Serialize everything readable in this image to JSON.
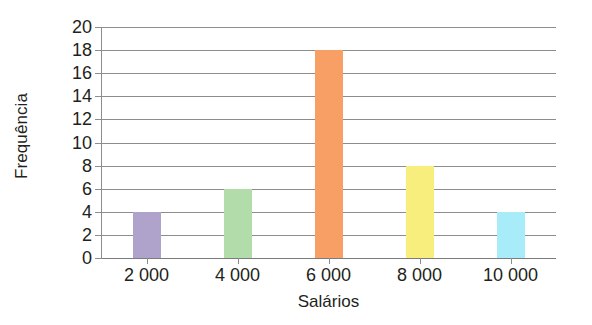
{
  "chart_data": {
    "type": "bar",
    "title": "",
    "xlabel": "Salários",
    "ylabel": "Frequência",
    "categories": [
      "2 000",
      "4 000",
      "6 000",
      "8 000",
      "10 000"
    ],
    "values": [
      4,
      6,
      18,
      8,
      4
    ],
    "bar_colors": [
      "#b0a3cb",
      "#b3dcab",
      "#f79f64",
      "#f8ee7e",
      "#a8ecfa"
    ],
    "ylim": [
      0,
      20
    ],
    "y_ticks": [
      0,
      2,
      4,
      6,
      8,
      10,
      12,
      14,
      16,
      18,
      20
    ],
    "y_tick_labels": [
      "0",
      "2",
      "4",
      "6",
      "8",
      "10",
      "12",
      "14",
      "16",
      "18",
      "20"
    ],
    "grid": true,
    "grid_axis": "y",
    "legend": "none",
    "series": [
      {
        "name": "Frequência",
        "points": [
          {
            "category": "2 000",
            "value": 4,
            "color": "#b0a3cb"
          },
          {
            "category": "4 000",
            "value": 6,
            "color": "#b3dcab"
          },
          {
            "category": "6 000",
            "value": 18,
            "color": "#f79f64"
          },
          {
            "category": "8 000",
            "value": 8,
            "color": "#f8ee7e"
          },
          {
            "category": "10 000",
            "value": 4,
            "color": "#a8ecfa"
          }
        ]
      }
    ],
    "axis_color": "#8d8d8d",
    "text_color": "#231f20",
    "background": "#ffffff"
  }
}
